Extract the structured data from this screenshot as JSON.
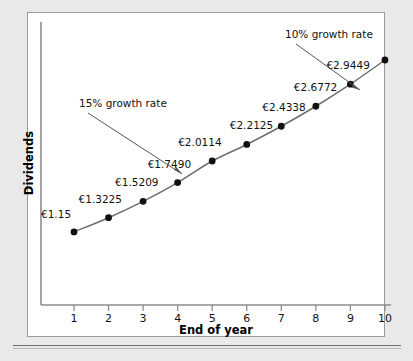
{
  "chart_data": {
    "type": "line",
    "title": "",
    "xlabel": "End of year",
    "ylabel": "Dividends",
    "x": [
      1,
      2,
      3,
      4,
      5,
      6,
      7,
      8,
      9,
      10
    ],
    "categories": [
      "1",
      "2",
      "3",
      "4",
      "5",
      "6",
      "7",
      "8",
      "9",
      "10"
    ],
    "values": [
      1.15,
      1.3225,
      1.5209,
      1.749,
      2.0114,
      2.2125,
      2.4338,
      2.6772,
      2.9449,
      3.2394
    ],
    "point_labels": [
      "€1.15",
      "€1.3225",
      "€1.5209",
      "€1.7490",
      "€2.0114",
      "€2.2125",
      "€2.4338",
      "€2.6772",
      "€2.9449",
      ""
    ],
    "annotations": [
      {
        "text": "15% growth rate",
        "points_to_year": 4
      },
      {
        "text": "10% growth rate",
        "points_to_year": 9.5
      }
    ],
    "xtick_labels": [
      "1",
      "2",
      "3",
      "4",
      "5",
      "6",
      "7",
      "8",
      "9",
      "10"
    ],
    "ytick_labels": [],
    "grid": false,
    "legend": false,
    "marker": "filled-circle",
    "line_color": "#6e6e6e",
    "marker_color": "#111111"
  },
  "axes": {
    "x_title": "End of year",
    "y_title": "Dividends"
  }
}
